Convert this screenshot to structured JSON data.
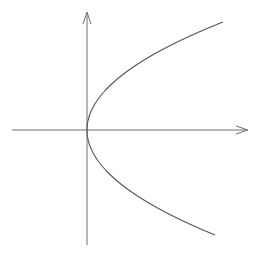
{
  "diagram": {
    "colors": {
      "axis": "#707070",
      "curve": "#555555",
      "background": "#ffffff"
    },
    "x_axis": {
      "x1": 12,
      "y": 130,
      "x2": 248,
      "arrow": "right"
    },
    "y_axis": {
      "x": 87,
      "y1": 245,
      "y2": 12,
      "arrow": "up"
    },
    "curve": {
      "type": "parabola",
      "equation": "x = y^2",
      "vertex": [
        87,
        130
      ],
      "upper_end": [
        223,
        22
      ],
      "lower_end": [
        215,
        235
      ]
    },
    "labels": []
  }
}
